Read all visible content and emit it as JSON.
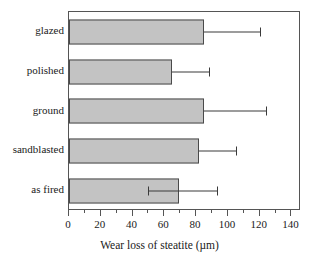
{
  "chart_data": {
    "type": "bar",
    "orientation": "horizontal",
    "title": "",
    "xlabel": "Wear loss of steatite (µm)",
    "ylabel": "",
    "categories": [
      "glazed",
      "polished",
      "ground",
      "sandblasted",
      "as fired"
    ],
    "values": [
      85,
      65,
      85,
      82,
      69
    ],
    "errors_upper": [
      120,
      88,
      124,
      105,
      93
    ],
    "errors_lower": [
      null,
      null,
      null,
      null,
      50
    ],
    "xlim": [
      0,
      146
    ],
    "xticks": [
      0,
      20,
      40,
      60,
      80,
      100,
      120,
      140
    ],
    "xtick_labels": [
      "0",
      "20",
      "40",
      "60",
      "80",
      "100",
      "120",
      "140"
    ],
    "xminor_ticks": [
      10,
      30,
      50,
      70,
      90,
      110,
      130
    ],
    "grid": false,
    "legend": false,
    "bar_fill_color": "#c3c3c3",
    "bar_edge_color": "#4a4a4a",
    "axis_color": "#555555",
    "series": [
      {
        "name": "Wear loss of steatite",
        "points": [
          {
            "category": "glazed",
            "value": 85,
            "err_high": 120,
            "err_low": null
          },
          {
            "category": "polished",
            "value": 65,
            "err_high": 88,
            "err_low": null
          },
          {
            "category": "ground",
            "value": 85,
            "err_high": 124,
            "err_low": null
          },
          {
            "category": "sandblasted",
            "value": 82,
            "err_high": 105,
            "err_low": null
          },
          {
            "category": "as fired",
            "value": 69,
            "err_high": 93,
            "err_low": 50
          }
        ]
      }
    ]
  }
}
